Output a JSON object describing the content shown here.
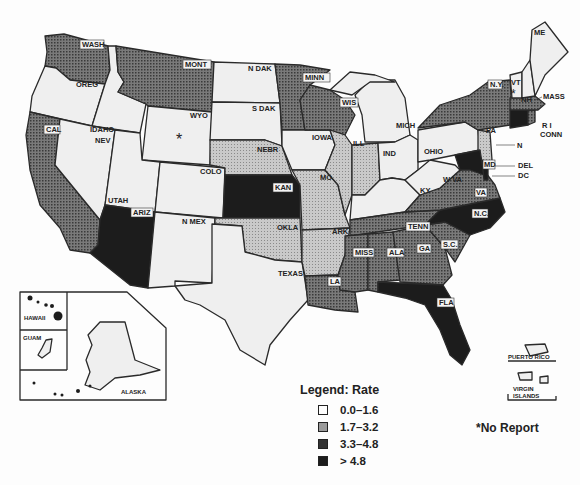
{
  "map": {
    "type": "choropleth",
    "region": "United States and territories",
    "legend": {
      "title": "Legend:  Rate",
      "classes": [
        {
          "range": "0.0-1.6",
          "fill": "#efefef",
          "label": "0.0–1.6"
        },
        {
          "range": "1.7-3.2",
          "fill": "#bdbdbd",
          "label": "1.7–3.2"
        },
        {
          "range": "3.3-4.8",
          "fill": "#6b6b6b",
          "label": "3.3–4.8"
        },
        {
          "range": ">4.8",
          "fill": "#1c1c1c",
          "label": "> 4.8"
        }
      ]
    },
    "no_report_note": "*No Report",
    "no_report_states": [
      "WYO",
      "VT"
    ],
    "states": [
      {
        "label": "WASH",
        "class": "3.3-4.8"
      },
      {
        "label": "OREG",
        "class": "0.0-1.6"
      },
      {
        "label": "CAL",
        "class": "3.3-4.8"
      },
      {
        "label": "IDAHO",
        "class": "0.0-1.6"
      },
      {
        "label": "NEV",
        "class": "0.0-1.6"
      },
      {
        "label": "MONT",
        "class": "3.3-4.8"
      },
      {
        "label": "WYO",
        "class": "no-report"
      },
      {
        "label": "UTAH",
        "class": "0.0-1.6"
      },
      {
        "label": "ARIZ",
        "class": ">4.8"
      },
      {
        "label": "COLO",
        "class": "0.0-1.6"
      },
      {
        "label": "N MEX",
        "class": "0.0-1.6"
      },
      {
        "label": "N DAK",
        "class": "0.0-1.6"
      },
      {
        "label": "S DAK",
        "class": "0.0-1.6"
      },
      {
        "label": "NEBR",
        "class": "1.7-3.2"
      },
      {
        "label": "KAN",
        "class": ">4.8"
      },
      {
        "label": "OKLA",
        "class": "1.7-3.2"
      },
      {
        "label": "TEXAS",
        "class": "0.0-1.6"
      },
      {
        "label": "MINN",
        "class": "3.3-4.8"
      },
      {
        "label": "IOWA",
        "class": "0.0-1.6"
      },
      {
        "label": "MO",
        "class": "1.7-3.2"
      },
      {
        "label": "ARK",
        "class": "1.7-3.2"
      },
      {
        "label": "LA",
        "class": "3.3-4.8"
      },
      {
        "label": "WIS",
        "class": "3.3-4.8"
      },
      {
        "label": "ILL",
        "class": "1.7-3.2"
      },
      {
        "label": "MICH",
        "class": "0.0-1.6"
      },
      {
        "label": "IND",
        "class": "1.7-3.2"
      },
      {
        "label": "OHIO",
        "class": "0.0-1.6"
      },
      {
        "label": "KY",
        "class": "0.0-1.6"
      },
      {
        "label": "TENN",
        "class": "3.3-4.8"
      },
      {
        "label": "MISS",
        "class": "3.3-4.8"
      },
      {
        "label": "ALA",
        "class": "3.3-4.8"
      },
      {
        "label": "GA",
        "class": "3.3-4.8"
      },
      {
        "label": "FLA",
        "class": ">4.8"
      },
      {
        "label": "S C",
        "class": "3.3-4.8"
      },
      {
        "label": "N C",
        "class": ">4.8"
      },
      {
        "label": "VA",
        "class": "3.3-4.8"
      },
      {
        "label": "W VA",
        "class": "0.0-1.6"
      },
      {
        "label": "PA",
        "class": "0.0-1.6"
      },
      {
        "label": "N Y",
        "class": "3.3-4.8"
      },
      {
        "label": "N J",
        "class": "1.7-3.2"
      },
      {
        "label": "DEL",
        "class": ">4.8"
      },
      {
        "label": "MD",
        "class": ">4.8"
      },
      {
        "label": "D C",
        "class": ">4.8"
      },
      {
        "label": "CONN",
        "class": ">4.8"
      },
      {
        "label": "R I",
        "class": "3.3-4.8"
      },
      {
        "label": "MASS",
        "class": "3.3-4.8"
      },
      {
        "label": "VT",
        "class": "no-report"
      },
      {
        "label": "N H",
        "class": "0.0-1.6"
      },
      {
        "label": "ME",
        "class": "0.0-1.6"
      },
      {
        "label": "ALASKA",
        "class": "0.0-1.6"
      },
      {
        "label": "HAWAII",
        "class": "0.0-1.6"
      },
      {
        "label": "GUAM",
        "class": "0.0-1.6"
      },
      {
        "label": "PUERTO RICO",
        "class": "0.0-1.6"
      },
      {
        "label": "VIRGIN ISLANDS",
        "class": "0.0-1.6"
      }
    ],
    "labels": {
      "wash": "WASH",
      "oreg": "OREG",
      "cal": "CAL",
      "idaho": "IDAHO",
      "nev": "NEV",
      "mont": "MONT",
      "wyo": "WYO",
      "utah": "UTAH",
      "ariz": "ARIZ",
      "colo": "COLO",
      "nmex": "N MEX",
      "ndak": "N DAK",
      "sdak": "S DAK",
      "nebr": "NEBR",
      "kan": "KAN",
      "okla": "OKLA",
      "texas": "TEXAS",
      "minn": "MINN",
      "iowa": "IOWA",
      "mo": "MO",
      "ark": "ARK",
      "la": "LA",
      "wis": "WIS",
      "ill": "ILL",
      "mich": "MICH",
      "ind": "IND",
      "ohio": "OHIO",
      "ky": "KY",
      "tenn": "TENN",
      "miss": "MISS",
      "ala": "ALA",
      "ga": "GA",
      "fla": "FLA",
      "sc": "S.C.",
      "nc": "N.C.",
      "va": "VA",
      "wva": "W VA",
      "pa": "PA",
      "ny": "N.Y.",
      "nj": "N",
      "del": "DEL",
      "md": "MD",
      "dc": "DC",
      "conn": "CONN",
      "ri": "R I",
      "mass": "MASS",
      "vt": "VT",
      "nh": "NH",
      "me": "ME",
      "alaska": "ALASKA",
      "hawaii": "HAWAII",
      "guam": "GUAM",
      "pr": "PUERTO RICO",
      "vi1": "VIRGIN",
      "vi2": "ISLANDS",
      "star": "*"
    }
  }
}
